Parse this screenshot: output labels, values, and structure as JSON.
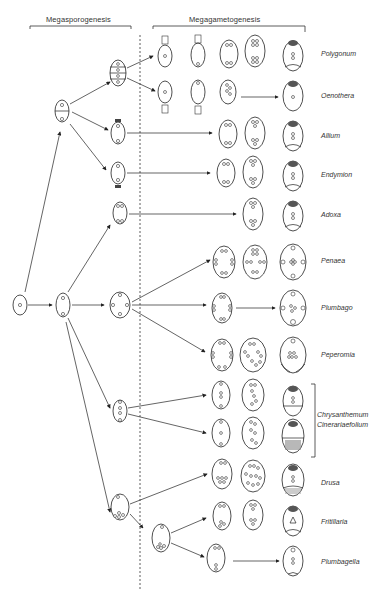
{
  "headers": {
    "megasporogenesis": "Megasporogenesis",
    "megagametogenesis": "Megagametogenesis"
  },
  "types": [
    {
      "name": "Polygonum",
      "y": 58
    },
    {
      "name": "Oenothera",
      "y": 97
    },
    {
      "name": "Allium",
      "y": 137
    },
    {
      "name": "Endymion",
      "y": 176
    },
    {
      "name": "Adoxa",
      "y": 216
    },
    {
      "name": "Penaea",
      "y": 262
    },
    {
      "name": "Plumbago",
      "y": 308
    },
    {
      "name": "Peperomia",
      "y": 355
    },
    {
      "name": "Chrysanthemum",
      "y": 410
    },
    {
      "name": "Cinerariaefolium",
      "y": 420
    },
    {
      "name": "Drusa",
      "y": 484
    },
    {
      "name": "Fritillaria",
      "y": 525
    },
    {
      "name": "Plumbagella",
      "y": 565
    }
  ],
  "colors": {
    "line": "#222222",
    "background": "#ffffff"
  }
}
